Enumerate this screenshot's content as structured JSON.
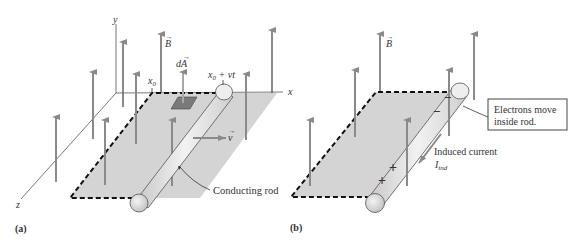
{
  "figure": {
    "panel_a": {
      "caption": "(a)",
      "axes": {
        "x": "x",
        "y": "y",
        "z": "z"
      },
      "labels": {
        "field": "B",
        "area_element": "dA",
        "start_position": "x",
        "start_sub": "0",
        "rod_position_base": "x",
        "rod_position_sub": "0",
        "rod_position_rest": " + vt",
        "velocity": "v",
        "rod_callout": "Conducting rod"
      }
    },
    "panel_b": {
      "caption": "(b)",
      "labels": {
        "field": "B",
        "callout_line1": "Electrons move",
        "callout_line2": "inside rod.",
        "current_label": "Induced current",
        "current_symbol": "I",
        "current_sub": "ind",
        "minus_sign": "−",
        "plus_sign": "+"
      }
    },
    "colors": {
      "arrow": "#8a8a8a",
      "plane": "#d4d4d4",
      "dashed_edge": "#111111",
      "axis": "#555555",
      "rod_fill": "#e6e6e6",
      "area_element": "#7a7a7a",
      "text": "#333333"
    }
  }
}
